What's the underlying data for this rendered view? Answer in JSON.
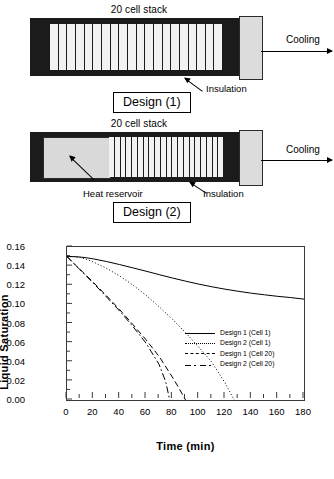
{
  "figure": {
    "designs": [
      {
        "id": "design-1",
        "stack_label": "20 cell stack",
        "cooling_label": "Cooling",
        "box_label": "Design (1)",
        "callouts": [
          "Insulation"
        ],
        "cell_count": 20
      },
      {
        "id": "design-2",
        "stack_label": "20 cell stack",
        "cooling_label": "Cooling",
        "box_label": "Design (2)",
        "callouts": [
          "Heat reservoir",
          "Insulation"
        ],
        "cell_count": 20
      }
    ]
  },
  "chart_data": {
    "type": "line",
    "title": "",
    "xlabel": "Time (min)",
    "ylabel": "Liquid Saturation",
    "xlim": [
      0,
      180
    ],
    "ylim": [
      0.0,
      0.16
    ],
    "xticks": [
      0,
      20,
      40,
      60,
      80,
      100,
      120,
      140,
      160,
      180
    ],
    "xtick_labels": [
      "0",
      "20",
      "40",
      "60",
      "80",
      "100",
      "120",
      "140",
      "160",
      "180"
    ],
    "yticks": [
      0.0,
      0.02,
      0.04,
      0.06,
      0.08,
      0.1,
      0.12,
      0.14,
      0.16
    ],
    "ytick_labels": [
      "0.00",
      "0.02",
      "0.04",
      "0.06",
      "0.08",
      "0.10",
      "0.12",
      "0.14",
      "0.16"
    ],
    "grid": false,
    "legend_position": "center-right",
    "series": [
      {
        "name": "Design 1 (Cell 1)",
        "style": "solid",
        "color": "#000000",
        "x": [
          0,
          5,
          10,
          15,
          20,
          30,
          40,
          50,
          60,
          70,
          80,
          90,
          100,
          110,
          120,
          130,
          140,
          150,
          160,
          170,
          180
        ],
        "y": [
          0.15,
          0.15,
          0.1495,
          0.1487,
          0.1476,
          0.1448,
          0.1416,
          0.1382,
          0.1347,
          0.1311,
          0.1276,
          0.1243,
          0.1212,
          0.1184,
          0.1159,
          0.1137,
          0.1117,
          0.11,
          0.1084,
          0.1071,
          0.1055
        ]
      },
      {
        "name": "Design 2 (Cell 1)",
        "style": "dotted",
        "color": "#000000",
        "x": [
          0,
          5,
          10,
          15,
          20,
          30,
          40,
          50,
          60,
          70,
          80,
          90,
          100,
          110,
          120,
          127
        ],
        "y": [
          0.15,
          0.1498,
          0.149,
          0.147,
          0.1443,
          0.1377,
          0.1297,
          0.1203,
          0.1095,
          0.0975,
          0.0845,
          0.0705,
          0.0555,
          0.0395,
          0.018,
          0.0
        ]
      },
      {
        "name": "Design 1 (Cell 20)",
        "style": "dashed",
        "color": "#000000",
        "x": [
          0,
          5,
          10,
          20,
          30,
          40,
          50,
          60,
          70,
          80,
          85,
          90
        ],
        "y": [
          0.15,
          0.143,
          0.1365,
          0.123,
          0.109,
          0.0945,
          0.079,
          0.063,
          0.0455,
          0.024,
          0.0125,
          0.0
        ]
      },
      {
        "name": "Design 2 (Cell 20)",
        "style": "dashdot",
        "color": "#000000",
        "x": [
          0,
          5,
          10,
          20,
          30,
          40,
          50,
          60,
          70,
          75,
          78
        ],
        "y": [
          0.15,
          0.143,
          0.136,
          0.1222,
          0.1078,
          0.093,
          0.077,
          0.0595,
          0.037,
          0.019,
          0.0
        ]
      }
    ]
  }
}
